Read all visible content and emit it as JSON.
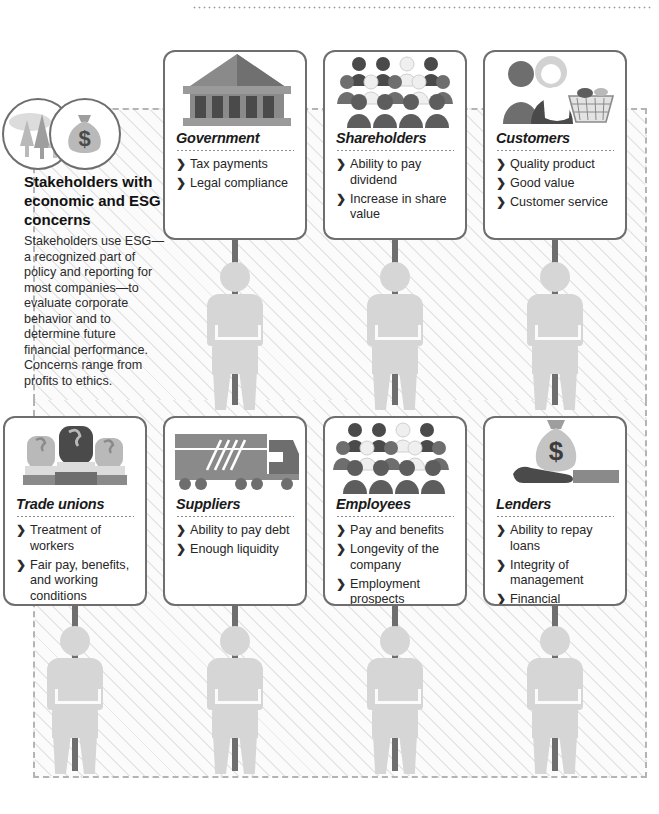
{
  "intro": {
    "heading": "Stakeholders with economic and ESG concerns",
    "body": "Stakeholders use ESG—a recognized part of policy and reporting for most companies—to evaluate corporate behavior and  to determine future financial performance. Concerns range from profits to ethics.",
    "icons": [
      "trees-icon",
      "money-bag-icon"
    ]
  },
  "bullet_glyph": "❯",
  "colors": {
    "card_border": "#6e6e6e",
    "hatch_line": "#e6e6e6",
    "dashed_border": "#b4b4b4",
    "ghost_person": "#d6d6d6",
    "pole": "#6e6e6e",
    "icon_dark": "#4a4a4a",
    "icon_mid": "#7d7d7d",
    "icon_light": "#b9b9b9",
    "text": "#262626"
  },
  "cards": [
    {
      "id": "government",
      "title": "Government",
      "icon": "government-building-icon",
      "items": [
        "Tax payments",
        "Legal compliance"
      ]
    },
    {
      "id": "shareholders",
      "title": "Shareholders",
      "icon": "crowd-of-people-icon",
      "items": [
        "Ability to pay dividend",
        "Increase in share value"
      ]
    },
    {
      "id": "customers",
      "title": "Customers",
      "icon": "shoppers-with-basket-icon",
      "items": [
        "Quality product",
        "Good value",
        "Customer service"
      ]
    },
    {
      "id": "trade-unions",
      "title": "Trade unions",
      "icon": "raised-fists-icon",
      "items": [
        "Treatment of workers",
        "Fair pay, benefits, and working conditions"
      ]
    },
    {
      "id": "suppliers",
      "title": "Suppliers",
      "icon": "delivery-truck-icon",
      "items": [
        "Ability to pay debt",
        "Enough liquidity"
      ]
    },
    {
      "id": "employees",
      "title": "Employees",
      "icon": "crowd-of-people-icon",
      "items": [
        "Pay and benefits",
        "Longevity of the company",
        "Employment prospects"
      ]
    },
    {
      "id": "lenders",
      "title": "Lenders",
      "icon": "hand-holding-money-bag-icon",
      "items": [
        "Ability to repay loans",
        "Integrity of management",
        "Financial strengths of the company"
      ]
    }
  ]
}
